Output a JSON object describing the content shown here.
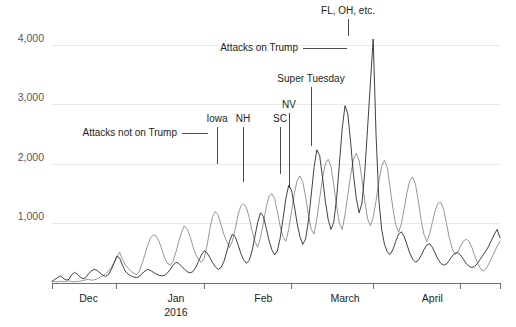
{
  "chart_data": {
    "type": "line",
    "title": "",
    "subtitle": "",
    "xlabel": "",
    "ylabel": "",
    "ylim": [
      0,
      4400
    ],
    "xlim": [
      0,
      160
    ],
    "grid": "horizontal",
    "legend": "inline-annotations",
    "y_ticks": [
      {
        "value": 1000,
        "label": "1,000"
      },
      {
        "value": 2000,
        "label": "2,000"
      },
      {
        "value": 3000,
        "label": "3,000"
      },
      {
        "value": 4000,
        "label": "4,000"
      }
    ],
    "x_ticks": [
      {
        "position": 13,
        "label": "Dec",
        "sublabel": ""
      },
      {
        "position": 44,
        "label": "Jan",
        "sublabel": "2016"
      },
      {
        "position": 75,
        "label": "Feb",
        "sublabel": ""
      },
      {
        "position": 104,
        "label": "March",
        "sublabel": ""
      },
      {
        "position": 135,
        "label": "April",
        "sublabel": ""
      }
    ],
    "x_tick_boundaries": [
      23,
      54,
      85,
      114,
      145
    ],
    "annotations": [
      {
        "name": "attacks-not-on-trump",
        "label": "Attacks not on Trump",
        "label_x": 177,
        "label_y": 136,
        "anchor": "end",
        "leader": [
          [
            182,
            133
          ],
          [
            208,
            133
          ]
        ]
      },
      {
        "name": "iowa",
        "label": "Iowa",
        "label_x": 217,
        "label_y": 122,
        "anchor": "middle",
        "leader": [
          [
            217,
            127
          ],
          [
            217,
            164
          ]
        ]
      },
      {
        "name": "new-hampshire",
        "label": "NH",
        "label_x": 243,
        "label_y": 122,
        "anchor": "middle",
        "leader": [
          [
            243,
            127
          ],
          [
            243,
            182
          ]
        ]
      },
      {
        "name": "south-carolina",
        "label": "SC",
        "label_x": 280,
        "label_y": 122,
        "anchor": "middle",
        "leader": [
          [
            280,
            127
          ],
          [
            280,
            174
          ]
        ]
      },
      {
        "name": "nevada",
        "label": "NV",
        "label_x": 289,
        "label_y": 108,
        "anchor": "middle",
        "leader": [
          [
            289,
            113
          ],
          [
            289,
            188
          ]
        ]
      },
      {
        "name": "super-tuesday",
        "label": "Super Tuesday",
        "label_x": 311,
        "label_y": 82,
        "anchor": "middle",
        "leader": [
          [
            311,
            87
          ],
          [
            311,
            146
          ]
        ]
      },
      {
        "name": "attacks-on-trump",
        "label": "Attacks on Trump",
        "label_x": 298,
        "label_y": 51,
        "anchor": "end",
        "leader": [
          [
            303,
            48
          ],
          [
            347,
            48
          ]
        ]
      },
      {
        "name": "fl-oh-etc",
        "label": "FL, OH, etc.",
        "label_x": 348,
        "label_y": 14,
        "anchor": "middle",
        "leader": [
          [
            348,
            19
          ],
          [
            348,
            36
          ]
        ]
      }
    ],
    "series": [
      {
        "name": "Attacks not on Trump",
        "color": "#8a8a8d",
        "values": [
          20,
          25,
          18,
          30,
          22,
          28,
          35,
          24,
          20,
          26,
          30,
          40,
          55,
          60,
          48,
          52,
          70,
          95,
          120,
          150,
          200,
          260,
          340,
          430,
          520,
          400,
          300,
          250,
          200,
          160,
          140,
          200,
          330,
          480,
          640,
          760,
          810,
          790,
          700,
          560,
          420,
          330,
          300,
          370,
          520,
          700,
          860,
          960,
          900,
          780,
          620,
          480,
          400,
          350,
          420,
          620,
          900,
          1120,
          1200,
          1140,
          980,
          820,
          700,
          600,
          700,
          900,
          1140,
          1290,
          1330,
          1270,
          1100,
          880,
          700,
          600,
          760,
          1000,
          1270,
          1460,
          1500,
          1420,
          1200,
          950,
          780,
          700,
          900,
          1200,
          1500,
          1720,
          1800,
          1700,
          1450,
          1150,
          900,
          820,
          1080,
          1420,
          1760,
          2000,
          2080,
          1960,
          1650,
          1300,
          1000,
          900,
          1150,
          1480,
          1820,
          2080,
          2180,
          2060,
          1750,
          1380,
          1080,
          960,
          1100,
          1380,
          1700,
          1960,
          2060,
          1940,
          1600,
          1250,
          980,
          850,
          1000,
          1250,
          1520,
          1720,
          1780,
          1660,
          1380,
          1060,
          820,
          700,
          820,
          1020,
          1220,
          1340,
          1360,
          1240,
          1000,
          760,
          580,
          480,
          520,
          620,
          700,
          740,
          700,
          600,
          460,
          340,
          250,
          200,
          240,
          320,
          420,
          520,
          620,
          700
        ]
      },
      {
        "name": "Attacks on Trump",
        "color": "#2b2b2b",
        "values": [
          30,
          60,
          90,
          120,
          80,
          50,
          60,
          140,
          180,
          150,
          100,
          70,
          90,
          160,
          200,
          230,
          210,
          170,
          130,
          110,
          140,
          220,
          330,
          450,
          420,
          300,
          200,
          150,
          120,
          100,
          90,
          110,
          160,
          200,
          230,
          210,
          180,
          150,
          130,
          120,
          130,
          170,
          230,
          300,
          350,
          330,
          280,
          230,
          190,
          170,
          190,
          260,
          360,
          470,
          540,
          510,
          430,
          340,
          270,
          230,
          260,
          360,
          520,
          700,
          820,
          780,
          650,
          500,
          390,
          330,
          380,
          540,
          780,
          1020,
          1180,
          1120,
          930,
          720,
          560,
          470,
          540,
          760,
          1080,
          1420,
          1640,
          1560,
          1300,
          1000,
          780,
          650,
          740,
          1040,
          1480,
          1940,
          2240,
          2140,
          1780,
          1380,
          1070,
          900,
          1020,
          1420,
          2000,
          2600,
          2980,
          2840,
          2360,
          1820,
          1420,
          1180,
          1340,
          1860,
          2600,
          3360,
          4100,
          2500,
          1400,
          900,
          650,
          520,
          480,
          560,
          700,
          820,
          860,
          780,
          640,
          500,
          400,
          350,
          380,
          460,
          560,
          640,
          660,
          600,
          500,
          400,
          330,
          300,
          320,
          380,
          450,
          500,
          510,
          470,
          400,
          330,
          280,
          260,
          280,
          330,
          400,
          470,
          540,
          620,
          720,
          820,
          900,
          760
        ]
      }
    ]
  }
}
